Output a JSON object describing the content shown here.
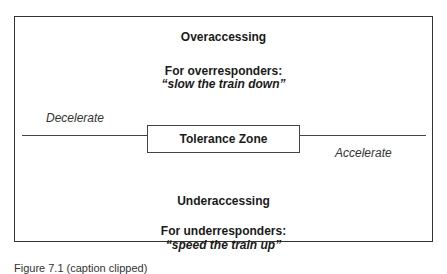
{
  "diagram": {
    "top": {
      "heading": "Overaccessing",
      "subheading": "For overresponders:",
      "quote": "“slow the train down”"
    },
    "left_label": "Decelerate",
    "center_box": "Tolerance Zone",
    "right_label": "Accelerate",
    "bottom": {
      "heading": "Underaccessing",
      "subheading": "For underresponders:",
      "quote": "“speed the train up”"
    }
  },
  "caption": "Figure 7.1 (caption clipped)"
}
